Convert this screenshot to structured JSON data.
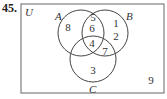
{
  "problem": {
    "number": "45."
  },
  "diagram": {
    "universe_label": "U",
    "sets": [
      {
        "name": "A",
        "cx": 81,
        "cy": 33,
        "r": 23,
        "label_x": 55,
        "label_y": 20
      },
      {
        "name": "B",
        "cx": 105,
        "cy": 33,
        "r": 23,
        "label_x": 126,
        "label_y": 20
      },
      {
        "name": "C",
        "cx": 93,
        "cy": 59,
        "r": 23,
        "label_x": 89,
        "label_y": 93
      }
    ],
    "regions": [
      {
        "id": "A_only",
        "value": "8",
        "x": 68,
        "y": 31
      },
      {
        "id": "A_and_B_only_top",
        "value": "5",
        "x": 93,
        "y": 21
      },
      {
        "id": "A_and_B_only",
        "value": "6",
        "x": 92,
        "y": 32
      },
      {
        "id": "B_only_1",
        "value": "1",
        "x": 116,
        "y": 27
      },
      {
        "id": "B_only_2",
        "value": "2",
        "x": 116,
        "y": 40
      },
      {
        "id": "A_B_C",
        "value": "4",
        "x": 92,
        "y": 47
      },
      {
        "id": "B_and_C_only",
        "value": "7",
        "x": 105,
        "y": 55
      },
      {
        "id": "C_only",
        "value": "3",
        "x": 93,
        "y": 74
      },
      {
        "id": "outside",
        "value": "9",
        "x": 151,
        "y": 84
      }
    ],
    "colors": {
      "stroke": "#444444",
      "text": "#333333",
      "background": "#ffffff"
    }
  }
}
